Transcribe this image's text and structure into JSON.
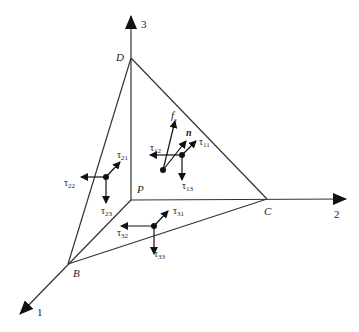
{
  "diagram": {
    "axes": [
      {
        "id": "axis-1",
        "label": "1"
      },
      {
        "id": "axis-2",
        "label": "2"
      },
      {
        "id": "axis-3",
        "label": "3"
      }
    ],
    "vertices": {
      "P": "P",
      "B": "B",
      "C": "C",
      "D": "D"
    },
    "face_n": {
      "traction": "f",
      "traction_sub": "s",
      "normal": "n",
      "components": [
        {
          "base": "τ",
          "sub": "11"
        },
        {
          "base": "τ",
          "sub": "12"
        },
        {
          "base": "τ",
          "sub": "13"
        }
      ]
    },
    "face_2": {
      "components": [
        {
          "base": "τ",
          "sub": "21"
        },
        {
          "base": "τ",
          "sub": "22"
        },
        {
          "base": "τ",
          "sub": "23"
        }
      ]
    },
    "face_3": {
      "components": [
        {
          "base": "τ",
          "sub": "31"
        },
        {
          "base": "τ",
          "sub": "32"
        },
        {
          "base": "τ",
          "sub": "33"
        }
      ]
    }
  }
}
